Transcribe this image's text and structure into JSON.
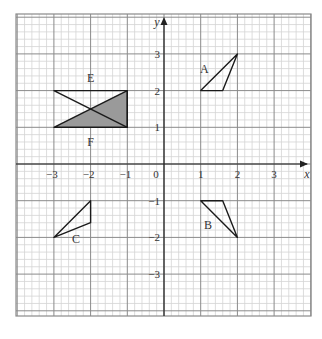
{
  "diagram": {
    "type": "coordinate-grid",
    "axes": {
      "x_label": "x",
      "y_label": "y",
      "origin_label": "0",
      "x_ticks": [
        {
          "value": -3,
          "label": "−3"
        },
        {
          "value": -2,
          "label": "−2"
        },
        {
          "value": -1,
          "label": "−1"
        },
        {
          "value": 1,
          "label": "1"
        },
        {
          "value": 2,
          "label": "2"
        },
        {
          "value": 3,
          "label": "3"
        }
      ],
      "y_ticks": [
        {
          "value": 3,
          "label": "3"
        },
        {
          "value": 2,
          "label": "2"
        },
        {
          "value": 1,
          "label": "1"
        },
        {
          "value": -1,
          "label": "−1"
        },
        {
          "value": -2,
          "label": "−2"
        },
        {
          "value": -3,
          "label": "−3"
        }
      ],
      "x_range": [
        -4,
        4
      ],
      "y_range": [
        -4,
        4
      ],
      "minor_step": 0.2
    },
    "shapes": [
      {
        "name": "A",
        "label": "A",
        "points": [
          [
            1,
            2
          ],
          [
            2,
            3
          ],
          [
            1.6,
            2
          ]
        ],
        "label_pos": [
          1.1,
          2.6
        ]
      },
      {
        "name": "B",
        "label": "B",
        "points": [
          [
            1,
            -1
          ],
          [
            1.6,
            -1
          ],
          [
            2,
            -2
          ]
        ],
        "label_pos": [
          1.2,
          -1.65
        ]
      },
      {
        "name": "C",
        "label": "C",
        "points": [
          [
            -3,
            -2
          ],
          [
            -2,
            -1
          ],
          [
            -2,
            -1.6
          ]
        ],
        "label_pos": [
          -2.4,
          -2.05
        ]
      },
      {
        "name": "E",
        "label": "E",
        "points": [
          [
            -3,
            2
          ],
          [
            -1,
            2
          ],
          [
            -1,
            1
          ]
        ],
        "label_pos": [
          -2,
          2.35
        ],
        "filled": false
      },
      {
        "name": "F",
        "label": "F",
        "points": [
          [
            -3,
            1
          ],
          [
            -1,
            1
          ],
          [
            -1,
            2
          ]
        ],
        "label_pos": [
          -2,
          0.6
        ],
        "filled": true
      }
    ],
    "colors": {
      "grid_minor": "#d4d4d4",
      "grid_major": "#8a8a8a",
      "axis": "#222222",
      "shape_stroke": "#1a1a1a",
      "shade_fill": "#9a9a9a"
    }
  }
}
